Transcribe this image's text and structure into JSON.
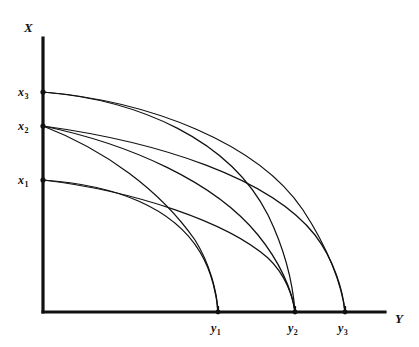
{
  "figure": {
    "title": "",
    "background_color": "#ffffff",
    "line_color": "#111111"
  },
  "axes": {
    "x_axis_label": "X",
    "y_axis_label": "Y",
    "vertical_axis": {
      "x": 43,
      "y_top": 38,
      "y_bottom": 312
    },
    "horizontal_axis": {
      "y": 312,
      "x_left": 43,
      "x_right": 385
    }
  },
  "labels": {
    "x_axis_name_pos": {
      "x": 24,
      "y": 32
    },
    "y_axis_name_pos": {
      "x": 395,
      "y": 323
    },
    "vertical_ticks": [
      {
        "base": "x",
        "sub": "1",
        "text": "x1",
        "px_y": 180,
        "label_x": 18,
        "label_y": 184
      },
      {
        "base": "x",
        "sub": "2",
        "text": "x2",
        "px_y": 126,
        "label_x": 18,
        "label_y": 130
      },
      {
        "base": "x",
        "sub": "3",
        "text": "x3",
        "px_y": 92,
        "label_x": 18,
        "label_y": 96
      }
    ],
    "horizontal_ticks": [
      {
        "base": "y",
        "sub": "1",
        "text": "y1",
        "px_x": 218,
        "label_x": 211,
        "label_y": 332
      },
      {
        "base": "y",
        "sub": "2",
        "text": "y2",
        "px_x": 295,
        "label_x": 288,
        "label_y": 332
      },
      {
        "base": "y",
        "sub": "3",
        "text": "y3",
        "px_x": 345,
        "label_x": 338,
        "label_y": 332
      }
    ]
  },
  "chart_data": {
    "type": "line",
    "title": "",
    "xlabel": "Y",
    "ylabel": "X",
    "grid": false,
    "legend": "none",
    "axis_origin_px": {
      "x": 43,
      "y": 312
    },
    "x_tick_labels": [
      "y1",
      "y2",
      "y3"
    ],
    "y_tick_labels": [
      "x1",
      "x2",
      "x3"
    ],
    "x_tick_px": [
      218,
      295,
      345
    ],
    "y_tick_px": [
      180,
      126,
      92
    ],
    "series": [
      {
        "name": "x3-to-y2",
        "start_label": "x3",
        "end_label": "y2",
        "path": "M 43 92 C 140 100, 230 140, 268 215 C 286 252, 293 285, 295 312"
      },
      {
        "name": "x3-to-y3",
        "start_label": "x3",
        "end_label": "y3",
        "path": "M 43 92 C 150 101, 258 143, 303 210 C 328 248, 342 285, 345 312"
      },
      {
        "name": "x2-to-y1",
        "start_label": "x2",
        "end_label": "y1",
        "path": "M 43 126 C 105 150, 160 190, 195 240 C 210 264, 217 292, 218 312"
      },
      {
        "name": "x2-to-y2",
        "start_label": "x2",
        "end_label": "y2",
        "path": "M 43 126 C 130 144, 215 182, 258 235 C 280 262, 292 290, 295 312"
      },
      {
        "name": "x2-to-y3",
        "start_label": "x2",
        "end_label": "y3",
        "path": "M 43 126 C 160 142, 270 178, 315 235 C 334 260, 343 290, 345 312"
      },
      {
        "name": "x1-to-y1",
        "start_label": "x1",
        "end_label": "y1",
        "path": "M 43 180 C 115 185, 173 207, 200 252 C 212 272, 217 296, 218 312"
      },
      {
        "name": "x1-to-y2",
        "start_label": "x1",
        "end_label": "y2",
        "path": "M 43 180 C 135 191, 227 222, 268 258 C 285 274, 293 296, 295 312"
      }
    ]
  }
}
